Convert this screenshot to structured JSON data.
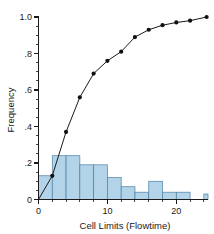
{
  "chart_data": {
    "type": "bar",
    "title": "",
    "xlabel": "Cell Limits (Flowtime)",
    "ylabel": "Frequency",
    "xlim": [
      0,
      24.6
    ],
    "ylim": [
      0,
      1.0
    ],
    "grid": false,
    "legend": null,
    "x_ticks": [
      {
        "value": 0,
        "label": "0",
        "major": true
      },
      {
        "value": 2,
        "label": "",
        "major": false
      },
      {
        "value": 4,
        "label": "",
        "major": false
      },
      {
        "value": 6,
        "label": "",
        "major": false
      },
      {
        "value": 8,
        "label": "",
        "major": false
      },
      {
        "value": 10,
        "label": "10",
        "major": true
      },
      {
        "value": 12,
        "label": "",
        "major": false
      },
      {
        "value": 14,
        "label": "",
        "major": false
      },
      {
        "value": 16,
        "label": "",
        "major": false
      },
      {
        "value": 18,
        "label": "",
        "major": false
      },
      {
        "value": 20,
        "label": "20",
        "major": true
      },
      {
        "value": 22,
        "label": "",
        "major": false
      },
      {
        "value": 24,
        "label": "",
        "major": false
      }
    ],
    "y_ticks": [
      {
        "value": 0.0,
        "label": "0",
        "major": true
      },
      {
        "value": 0.05,
        "label": "",
        "major": false
      },
      {
        "value": 0.1,
        "label": "",
        "major": false
      },
      {
        "value": 0.15,
        "label": "",
        "major": false
      },
      {
        "value": 0.2,
        "label": ".2",
        "major": true
      },
      {
        "value": 0.25,
        "label": "",
        "major": false
      },
      {
        "value": 0.3,
        "label": "",
        "major": false
      },
      {
        "value": 0.35,
        "label": "",
        "major": false
      },
      {
        "value": 0.4,
        "label": ".4",
        "major": true
      },
      {
        "value": 0.45,
        "label": "",
        "major": false
      },
      {
        "value": 0.5,
        "label": "",
        "major": false
      },
      {
        "value": 0.55,
        "label": "",
        "major": false
      },
      {
        "value": 0.6,
        "label": ".6",
        "major": true
      },
      {
        "value": 0.65,
        "label": "",
        "major": false
      },
      {
        "value": 0.7,
        "label": "",
        "major": false
      },
      {
        "value": 0.75,
        "label": "",
        "major": false
      },
      {
        "value": 0.8,
        "label": ".8",
        "major": true
      },
      {
        "value": 0.85,
        "label": "",
        "major": false
      },
      {
        "value": 0.9,
        "label": "",
        "major": false
      },
      {
        "value": 0.95,
        "label": "",
        "major": false
      },
      {
        "value": 1.0,
        "label": "1.0",
        "major": true
      }
    ],
    "series": [
      {
        "name": "Frequency histogram",
        "type": "bar",
        "bin_width": 2,
        "bin_edges": [
          0,
          2,
          4,
          6,
          8,
          10,
          12,
          14,
          16,
          18,
          20,
          22,
          24,
          24.6
        ],
        "values": [
          0.13,
          0.24,
          0.24,
          0.19,
          0.19,
          0.12,
          0.07,
          0.04,
          0.1,
          0.04,
          0.04,
          0.0,
          0.03
        ],
        "fill_color": "#b3d4e8",
        "edge_color": "#4a7fa5"
      },
      {
        "name": "Cumulative frequency",
        "type": "line",
        "marker": "circle",
        "line_color": "#1a1a1a",
        "marker_color": "#111111",
        "x": [
          0,
          2,
          4,
          6,
          8,
          10,
          12,
          14,
          16,
          18,
          20,
          22,
          24.4
        ],
        "y": [
          0.0,
          0.13,
          0.37,
          0.56,
          0.69,
          0.76,
          0.81,
          0.89,
          0.93,
          0.955,
          0.97,
          0.98,
          1.0
        ]
      }
    ]
  }
}
